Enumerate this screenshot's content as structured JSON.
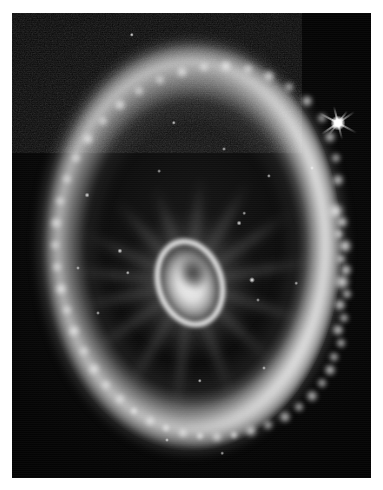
{
  "page": {
    "background_color": "#ffffff",
    "width": 383,
    "height": 490
  },
  "plate": {
    "name": "astronomical-photograph",
    "subject": "Cartwheel Galaxy",
    "description": "Grayscale telescope image of a ring galaxy showing a bright outer star-forming ring, faint radial spoke filaments, and a bright elliptical nucleus with an interior dust lane.",
    "palette": {
      "sky": "#020202",
      "ring": "#d6d6d6",
      "knot_bright": "#ffffff",
      "nucleus": "#f4f4f4",
      "dust_lane": "#1a1a1a",
      "border": "#ffffff"
    },
    "frame": {
      "left": 12,
      "top": 13,
      "width": 359,
      "height": 465
    }
  },
  "objects": {
    "outer_ring": {
      "label": "outer-star-forming-ring",
      "center_x": 179,
      "center_y": 232,
      "semi_axis_x": 148,
      "semi_axis_y": 202,
      "brightest_limb": "right"
    },
    "nucleus": {
      "label": "galaxy-nucleus",
      "center_x": 178,
      "center_y": 272,
      "width": 62,
      "height": 84,
      "tilt_degrees": -18
    },
    "foreground_star": {
      "label": "foreground-star-with-diffraction-spikes",
      "center_x": 326,
      "center_y": 110,
      "size": 15
    },
    "spokes": [
      {
        "angle": 205,
        "length": 120
      },
      {
        "angle": 228,
        "length": 112
      },
      {
        "angle": 250,
        "length": 104
      },
      {
        "angle": 276,
        "length": 108
      },
      {
        "angle": 300,
        "length": 118
      },
      {
        "angle": 325,
        "length": 126
      },
      {
        "angle": 350,
        "length": 130
      },
      {
        "angle": 18,
        "length": 126
      },
      {
        "angle": 44,
        "length": 118
      },
      {
        "angle": 70,
        "length": 126
      },
      {
        "angle": 96,
        "length": 134
      },
      {
        "angle": 120,
        "length": 128
      },
      {
        "angle": 145,
        "length": 122
      },
      {
        "angle": 168,
        "length": 116
      },
      {
        "angle": 186,
        "length": 124
      }
    ],
    "ring_knots": [
      {
        "x": 324,
        "y": 198,
        "r": 9,
        "b": 1.0
      },
      {
        "x": 330,
        "y": 209,
        "r": 7,
        "b": 0.95
      },
      {
        "x": 327,
        "y": 221,
        "r": 6,
        "b": 0.88
      },
      {
        "x": 333,
        "y": 233,
        "r": 8,
        "b": 0.96
      },
      {
        "x": 329,
        "y": 246,
        "r": 6,
        "b": 0.85
      },
      {
        "x": 334,
        "y": 257,
        "r": 7,
        "b": 0.92
      },
      {
        "x": 330,
        "y": 269,
        "r": 9,
        "b": 1.0
      },
      {
        "x": 335,
        "y": 281,
        "r": 6,
        "b": 0.86
      },
      {
        "x": 328,
        "y": 292,
        "r": 7,
        "b": 0.9
      },
      {
        "x": 332,
        "y": 305,
        "r": 6,
        "b": 0.82
      },
      {
        "x": 326,
        "y": 317,
        "r": 7,
        "b": 0.9
      },
      {
        "x": 329,
        "y": 330,
        "r": 6,
        "b": 0.84
      },
      {
        "x": 322,
        "y": 344,
        "r": 6,
        "b": 0.82
      },
      {
        "x": 318,
        "y": 357,
        "r": 7,
        "b": 0.88
      },
      {
        "x": 310,
        "y": 370,
        "r": 6,
        "b": 0.8
      },
      {
        "x": 300,
        "y": 383,
        "r": 7,
        "b": 0.86
      },
      {
        "x": 287,
        "y": 394,
        "r": 6,
        "b": 0.8
      },
      {
        "x": 273,
        "y": 404,
        "r": 7,
        "b": 0.84
      },
      {
        "x": 256,
        "y": 412,
        "r": 6,
        "b": 0.78
      },
      {
        "x": 239,
        "y": 418,
        "r": 7,
        "b": 0.88
      },
      {
        "x": 222,
        "y": 422,
        "r": 5,
        "b": 0.76
      },
      {
        "x": 205,
        "y": 424,
        "r": 6,
        "b": 0.82
      },
      {
        "x": 188,
        "y": 423,
        "r": 5,
        "b": 0.74
      },
      {
        "x": 171,
        "y": 420,
        "r": 6,
        "b": 0.8
      },
      {
        "x": 154,
        "y": 415,
        "r": 5,
        "b": 0.72
      },
      {
        "x": 138,
        "y": 408,
        "r": 6,
        "b": 0.78
      },
      {
        "x": 122,
        "y": 398,
        "r": 5,
        "b": 0.7
      },
      {
        "x": 108,
        "y": 386,
        "r": 6,
        "b": 0.74
      },
      {
        "x": 94,
        "y": 372,
        "r": 6,
        "b": 0.72
      },
      {
        "x": 82,
        "y": 356,
        "r": 7,
        "b": 0.78
      },
      {
        "x": 72,
        "y": 338,
        "r": 6,
        "b": 0.7
      },
      {
        "x": 62,
        "y": 318,
        "r": 7,
        "b": 0.82
      },
      {
        "x": 55,
        "y": 297,
        "r": 6,
        "b": 0.72
      },
      {
        "x": 49,
        "y": 276,
        "r": 7,
        "b": 0.86
      },
      {
        "x": 45,
        "y": 254,
        "r": 6,
        "b": 0.74
      },
      {
        "x": 43,
        "y": 232,
        "r": 6,
        "b": 0.7
      },
      {
        "x": 44,
        "y": 210,
        "r": 7,
        "b": 0.8
      },
      {
        "x": 48,
        "y": 188,
        "r": 6,
        "b": 0.72
      },
      {
        "x": 55,
        "y": 166,
        "r": 6,
        "b": 0.7
      },
      {
        "x": 64,
        "y": 145,
        "r": 6,
        "b": 0.74
      },
      {
        "x": 76,
        "y": 126,
        "r": 7,
        "b": 0.82
      },
      {
        "x": 91,
        "y": 108,
        "r": 6,
        "b": 0.72
      },
      {
        "x": 108,
        "y": 92,
        "r": 7,
        "b": 0.84
      },
      {
        "x": 127,
        "y": 78,
        "r": 6,
        "b": 0.74
      },
      {
        "x": 148,
        "y": 67,
        "r": 6,
        "b": 0.72
      },
      {
        "x": 170,
        "y": 59,
        "r": 7,
        "b": 0.8
      },
      {
        "x": 192,
        "y": 54,
        "r": 6,
        "b": 0.76
      },
      {
        "x": 214,
        "y": 53,
        "r": 7,
        "b": 0.84
      },
      {
        "x": 236,
        "y": 56,
        "r": 6,
        "b": 0.76
      },
      {
        "x": 257,
        "y": 63,
        "r": 7,
        "b": 0.86
      },
      {
        "x": 277,
        "y": 74,
        "r": 6,
        "b": 0.78
      },
      {
        "x": 295,
        "y": 88,
        "r": 7,
        "b": 0.88
      },
      {
        "x": 310,
        "y": 105,
        "r": 6,
        "b": 0.8
      },
      {
        "x": 318,
        "y": 124,
        "r": 7,
        "b": 0.86
      },
      {
        "x": 324,
        "y": 145,
        "r": 6,
        "b": 0.78
      },
      {
        "x": 326,
        "y": 167,
        "r": 7,
        "b": 0.88
      }
    ],
    "point_stars": [
      {
        "x": 120,
        "y": 22,
        "r": 2.2,
        "b": 0.95
      },
      {
        "x": 227,
        "y": 210,
        "r": 2.4,
        "b": 0.92
      },
      {
        "x": 240,
        "y": 267,
        "r": 3.0,
        "b": 1.0
      },
      {
        "x": 246,
        "y": 287,
        "r": 2.0,
        "b": 0.7
      },
      {
        "x": 232,
        "y": 200,
        "r": 1.8,
        "b": 0.72
      },
      {
        "x": 257,
        "y": 163,
        "r": 2.1,
        "b": 0.8
      },
      {
        "x": 212,
        "y": 136,
        "r": 2.0,
        "b": 0.78
      },
      {
        "x": 162,
        "y": 110,
        "r": 2.2,
        "b": 0.85
      },
      {
        "x": 147,
        "y": 158,
        "r": 1.9,
        "b": 0.7
      },
      {
        "x": 108,
        "y": 238,
        "r": 2.6,
        "b": 0.95
      },
      {
        "x": 75,
        "y": 182,
        "r": 2.4,
        "b": 0.88
      },
      {
        "x": 116,
        "y": 260,
        "r": 2.2,
        "b": 0.82
      },
      {
        "x": 86,
        "y": 300,
        "r": 2.0,
        "b": 0.76
      },
      {
        "x": 188,
        "y": 368,
        "r": 2.2,
        "b": 0.84
      },
      {
        "x": 252,
        "y": 355,
        "r": 2.0,
        "b": 0.78
      },
      {
        "x": 284,
        "y": 270,
        "r": 1.8,
        "b": 0.72
      },
      {
        "x": 300,
        "y": 155,
        "r": 2.0,
        "b": 0.76
      },
      {
        "x": 66,
        "y": 255,
        "r": 2.0,
        "b": 0.74
      },
      {
        "x": 155,
        "y": 427,
        "r": 2.0,
        "b": 0.8
      },
      {
        "x": 210,
        "y": 440,
        "r": 1.8,
        "b": 0.7
      }
    ]
  }
}
